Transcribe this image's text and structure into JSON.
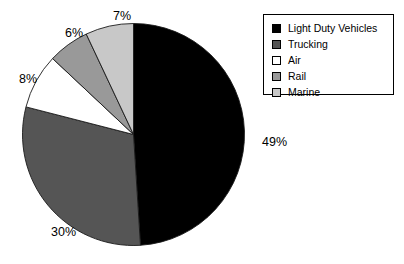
{
  "chart_data": {
    "type": "pie",
    "title": "",
    "subtitle": "",
    "xlabel": "",
    "ylabel": "",
    "grid": false,
    "legend_position": "top-right",
    "start_angle_deg": 0,
    "direction": "clockwise",
    "center": {
      "cx": 133.5,
      "cy": 134.5,
      "r": 111
    },
    "categories": [
      "Light Duty Vehicles",
      "Trucking",
      "Air",
      "Rail",
      "Marine"
    ],
    "values": [
      49,
      30,
      8,
      6,
      7
    ],
    "value_unit": "%",
    "slices": [
      {
        "label": "Light Duty Vehicles",
        "value": 49,
        "display": "49%",
        "color": "#000000",
        "label_x": 262,
        "label_y": 143
      },
      {
        "label": "Trucking",
        "value": 30,
        "display": "30%",
        "color": "#555555",
        "label_x": 51,
        "label_y": 233
      },
      {
        "label": "Air",
        "value": 8,
        "display": "8%",
        "color": "#ffffff",
        "label_x": 19,
        "label_y": 80
      },
      {
        "label": "Rail",
        "value": 6,
        "display": "6%",
        "color": "#999999",
        "label_x": 65,
        "label_y": 34
      },
      {
        "label": "Marine",
        "value": 7,
        "display": "7%",
        "color": "#c8c8c8",
        "label_x": 113,
        "label_y": 17
      }
    ]
  },
  "legend": {
    "items": [
      {
        "label": "Light Duty Vehicles",
        "color": "#000000"
      },
      {
        "label": "Trucking",
        "color": "#555555"
      },
      {
        "label": "Air",
        "color": "#ffffff"
      },
      {
        "label": "Rail",
        "color": "#999999"
      },
      {
        "label": "Marine",
        "color": "#c8c8c8"
      }
    ]
  }
}
